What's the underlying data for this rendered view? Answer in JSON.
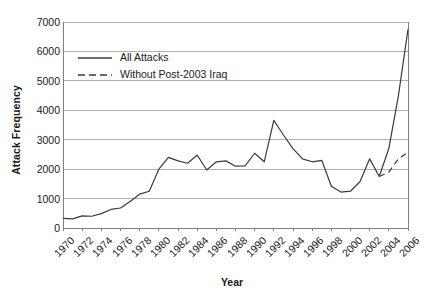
{
  "chart_data": {
    "type": "line",
    "title": "",
    "xlabel": "Year",
    "ylabel": "Attack Frequency",
    "xlim": [
      1970,
      2006
    ],
    "ylim": [
      0,
      7000
    ],
    "yticks": [
      0,
      1000,
      2000,
      3000,
      4000,
      5000,
      6000,
      7000
    ],
    "ytick_labels": [
      "0",
      "1000",
      "2000",
      "3000",
      "4000",
      "5000",
      "6000",
      "7000"
    ],
    "xticks": [
      1970,
      1972,
      1974,
      1976,
      1978,
      1980,
      1982,
      1984,
      1986,
      1988,
      1990,
      1992,
      1994,
      1996,
      1998,
      2000,
      2002,
      2004,
      2006
    ],
    "xtick_labels": [
      "1970",
      "1972",
      "1974",
      "1976",
      "1978",
      "1980",
      "1982",
      "1984",
      "1986",
      "1988",
      "1990",
      "1992",
      "1994",
      "1996",
      "1998",
      "2000",
      "2002",
      "2004",
      "2006"
    ],
    "grid": true,
    "grid_axis": "y",
    "legend_position": "upper-left",
    "line_color": "#3a3a3a",
    "grid_color": "#b0b0b0",
    "axis_color": "#808080",
    "series": [
      {
        "name": "All Attacks",
        "style": "solid",
        "x": [
          1970,
          1971,
          1972,
          1973,
          1974,
          1975,
          1976,
          1977,
          1978,
          1979,
          1980,
          1981,
          1982,
          1983,
          1984,
          1985,
          1986,
          1987,
          1988,
          1989,
          1990,
          1991,
          1992,
          1993,
          1994,
          1995,
          1996,
          1997,
          1998,
          1999,
          2000,
          2001,
          2002,
          2003,
          2004,
          2005,
          2006
        ],
        "values": [
          330,
          310,
          410,
          400,
          490,
          630,
          680,
          900,
          1150,
          1250,
          2000,
          2400,
          2280,
          2200,
          2480,
          1970,
          2250,
          2280,
          2100,
          2110,
          2540,
          2250,
          3660,
          3160,
          2700,
          2350,
          2250,
          2300,
          1420,
          1220,
          1250,
          1580,
          2350,
          1750,
          2700,
          4500,
          6750
        ]
      },
      {
        "name": "Without Post-2003 Iraq",
        "style": "dashed",
        "x": [
          2003,
          2004,
          2005,
          2006
        ],
        "values": [
          1750,
          1900,
          2350,
          2570
        ]
      }
    ]
  },
  "legend": {
    "items": [
      {
        "label": "All Attacks",
        "style": "solid"
      },
      {
        "label": "Without Post-2003 Iraq",
        "style": "dashed"
      }
    ]
  }
}
